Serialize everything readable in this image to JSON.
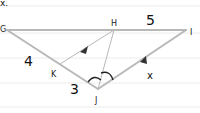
{
  "diagram": {
    "type": "geometry-triangle",
    "background": "lined-paper",
    "partial_top_text": "x.",
    "points": {
      "G": {
        "label": "G"
      },
      "H": {
        "label": "H"
      },
      "I": {
        "label": "I"
      },
      "J": {
        "label": "J"
      },
      "K": {
        "label": "K"
      }
    },
    "segments": [
      {
        "from": "G",
        "to": "I",
        "note": "top side"
      },
      {
        "from": "G",
        "to": "J"
      },
      {
        "from": "J",
        "to": "I",
        "parallel_arrow": true
      },
      {
        "from": "K",
        "to": "H",
        "parallel_arrow": true
      },
      {
        "from": "J",
        "to": "H",
        "note": "angle bisector"
      }
    ],
    "measures": {
      "GK": "4",
      "KJ": "3",
      "HI": "5",
      "JI": "x"
    },
    "angle_marks": "two equal arcs at J",
    "colors": {
      "line": "#b5b5b5",
      "text": "#111111",
      "rule": "#e6e6e6"
    }
  }
}
